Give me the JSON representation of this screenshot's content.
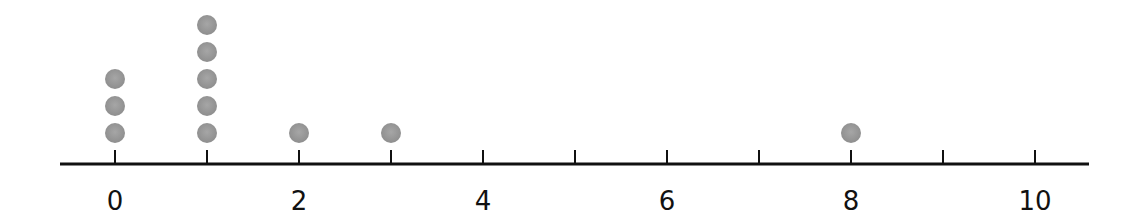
{
  "chart_data": {
    "type": "dot_plot",
    "title": "",
    "xlabel": "",
    "ylabel": "",
    "xlim": [
      0,
      10
    ],
    "x_ticks": [
      0,
      1,
      2,
      3,
      4,
      5,
      6,
      7,
      8,
      9,
      10
    ],
    "x_tick_labels": [
      "0",
      "2",
      "4",
      "6",
      "8",
      "10"
    ],
    "labeled_tick_values": [
      0,
      2,
      4,
      6,
      8,
      10
    ],
    "grid": false,
    "legend": null,
    "categories": [
      0,
      1,
      2,
      3,
      8
    ],
    "values": [
      3,
      5,
      1,
      1,
      1
    ],
    "points": [
      0,
      0,
      0,
      1,
      1,
      1,
      1,
      1,
      2,
      3,
      8
    ],
    "dot_color": "#9a9a9a",
    "axis_color": "#111111"
  }
}
